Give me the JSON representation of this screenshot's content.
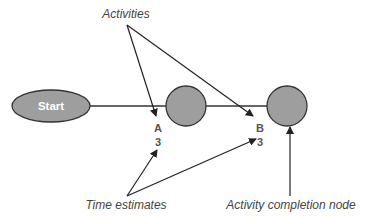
{
  "diagram": {
    "type": "activity-on-arrow network",
    "colors": {
      "node_fill": "#9e9e9e",
      "node_stroke": "#333333",
      "line": "#333333",
      "start_text": "#ffffff"
    },
    "nodes": [
      {
        "id": "start",
        "label": "Start",
        "shape": "ellipse"
      },
      {
        "id": "n1",
        "label": "",
        "shape": "circle"
      },
      {
        "id": "n2",
        "label": "",
        "shape": "circle"
      }
    ],
    "activities": [
      {
        "name": "A",
        "time": "3",
        "from": "start",
        "to": "n1"
      },
      {
        "name": "B",
        "time": "3",
        "from": "n1",
        "to": "n2"
      }
    ],
    "annotations": {
      "activities": "Activities",
      "time_estimates": "Time estimates",
      "completion_node": "Activity completion node"
    }
  }
}
